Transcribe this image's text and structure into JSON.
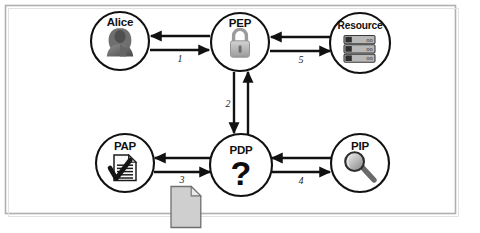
{
  "figure": {
    "frame": {
      "border_color": "#b0b0b0",
      "background": "#ffffff"
    },
    "nodes": [
      {
        "id": "alice",
        "label": "Alice",
        "icon": "person-icon",
        "cx": 120,
        "cy": 41,
        "r": 29
      },
      {
        "id": "pep",
        "label": "PEP",
        "icon": "padlock-icon",
        "cx": 240,
        "cy": 42,
        "r": 29
      },
      {
        "id": "resource",
        "label": "Resource",
        "icon": "server-stack-icon",
        "cx": 360,
        "cy": 43,
        "r": 30
      },
      {
        "id": "pap",
        "label": "PAP",
        "icon": "document-check-icon",
        "cx": 125,
        "cy": 163,
        "r": 29
      },
      {
        "id": "pdp",
        "label": "PDP",
        "icon": "question-mark-icon",
        "cx": 241,
        "cy": 165,
        "r": 31
      },
      {
        "id": "pip",
        "label": "PIP",
        "icon": "magnifier-icon",
        "cx": 360,
        "cy": 163,
        "r": 29
      }
    ],
    "edges": [
      {
        "id": "edge-1",
        "label": "1",
        "from": "alice",
        "to": "pep",
        "orientation": "horizontal",
        "label_x": 180,
        "label_y": 61
      },
      {
        "id": "edge-2",
        "label": "2",
        "from": "pep",
        "to": "pdp",
        "orientation": "vertical",
        "label_x": 229,
        "label_y": 106
      },
      {
        "id": "edge-3",
        "label": "3",
        "from": "pap",
        "to": "pdp",
        "orientation": "horizontal",
        "label_x": 182,
        "label_y": 182
      },
      {
        "id": "edge-4",
        "label": "4",
        "from": "pdp",
        "to": "pip",
        "orientation": "horizontal",
        "label_x": 301,
        "label_y": 183
      },
      {
        "id": "edge-5",
        "label": "5",
        "from": "pep",
        "to": "resource",
        "orientation": "horizontal",
        "label_x": 301,
        "label_y": 62
      }
    ],
    "decorations": [
      {
        "id": "policy-document",
        "icon": "page-document-icon",
        "x": 171,
        "y": 185,
        "width": 30,
        "height": 42,
        "fill": "#cfcfcf"
      }
    ],
    "colors": {
      "stroke": "#111111",
      "icon_gray": "#9a9a9a",
      "icon_dark": "#4d4d4d",
      "document_gray": "#cfcfcf",
      "frame": "#b0b0b0"
    }
  }
}
